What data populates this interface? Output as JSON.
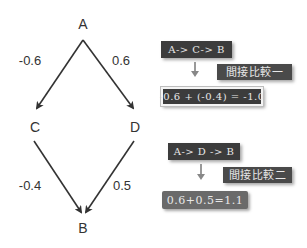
{
  "graph": {
    "nodes": [
      {
        "id": "A",
        "label": "A"
      },
      {
        "id": "C",
        "label": "C"
      },
      {
        "id": "D",
        "label": "D"
      },
      {
        "id": "B",
        "label": "B"
      }
    ],
    "edges": [
      {
        "from": "A",
        "to": "C",
        "label": "-0.6"
      },
      {
        "from": "A",
        "to": "D",
        "label": "0.6"
      },
      {
        "from": "C",
        "to": "B",
        "label": "-0.4"
      },
      {
        "from": "D",
        "to": "B",
        "label": "0.5"
      }
    ]
  },
  "comparison1": {
    "path": "A-> C-> B",
    "tag": "間接比較一",
    "result": "-0.6 + (-0.4) = -1.0"
  },
  "comparison2": {
    "path": "A-> D -> B",
    "tag": "間接比較二",
    "result": "0.6+0.5=1.1"
  },
  "colors": {
    "box_dark": "#3c3c3c",
    "box_light": "#6a6a6a",
    "line": "#333333"
  }
}
